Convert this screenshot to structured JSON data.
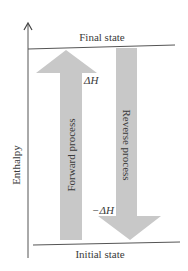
{
  "diagram": {
    "y_axis_label": "Enthalpy",
    "top_level_label": "Final state",
    "bottom_level_label": "Initial state",
    "forward_arrow": {
      "label": "Forward process",
      "delta_label": "ΔH",
      "direction": "up"
    },
    "reverse_arrow": {
      "label": "Reverse process",
      "delta_label": "−ΔH",
      "direction": "down"
    },
    "colors": {
      "arrow_fill": "#c8c8c8",
      "line": "#555555",
      "text": "#3a3a3a",
      "background": "#ffffff"
    }
  }
}
